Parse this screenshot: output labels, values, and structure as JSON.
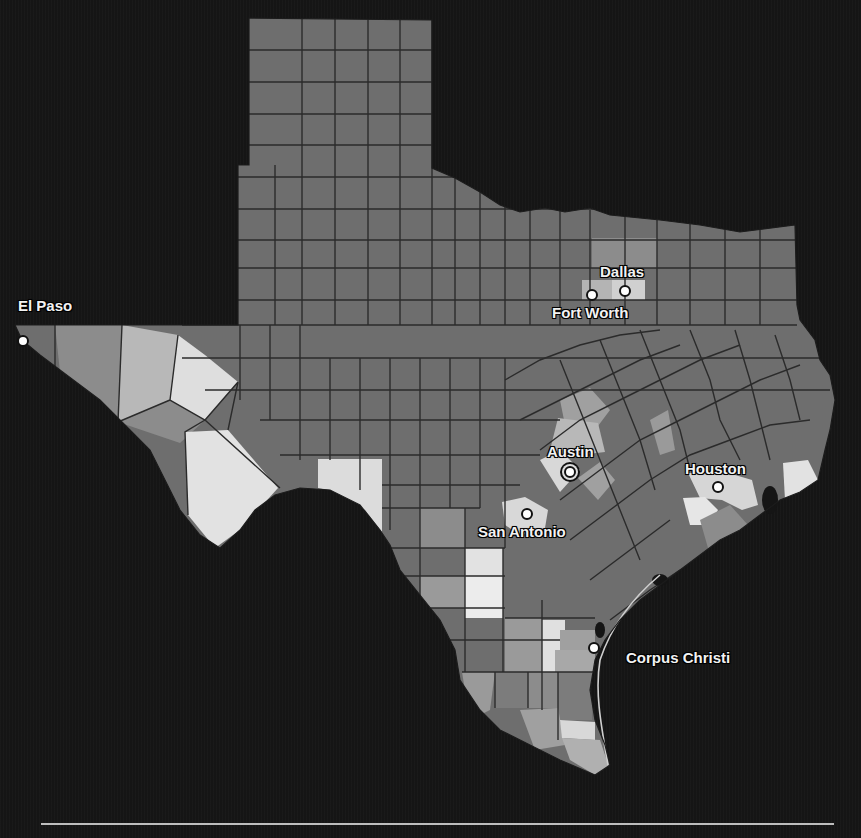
{
  "map": {
    "title": "Texas counties",
    "colors": {
      "background": "#151515",
      "county_base": "#6e6e6e",
      "county_mid": "#8c8c8c",
      "county_light": "#b4b4b4",
      "county_lightest": "#dcdcdc",
      "border": "#2a2a2a",
      "water": "#151515"
    },
    "cities": [
      {
        "name": "El Paso",
        "x": 23,
        "y": 341,
        "label_x": 18,
        "label_y": 298,
        "capital": false
      },
      {
        "name": "Dallas",
        "x": 625,
        "y": 291,
        "label_x": 600,
        "label_y": 263,
        "capital": false
      },
      {
        "name": "Fort Worth",
        "x": 592,
        "y": 295,
        "label_x": 552,
        "label_y": 305,
        "capital": false
      },
      {
        "name": "Austin",
        "x": 570,
        "y": 472,
        "label_x": 547,
        "label_y": 443,
        "capital": true
      },
      {
        "name": "San Antonio",
        "x": 527,
        "y": 514,
        "label_x": 478,
        "label_y": 524,
        "capital": false
      },
      {
        "name": "Houston",
        "x": 718,
        "y": 487,
        "label_x": 685,
        "label_y": 460,
        "capital": false
      },
      {
        "name": "Corpus Christi",
        "x": 594,
        "y": 648,
        "label_x": 626,
        "label_y": 650,
        "capital": false
      }
    ]
  }
}
